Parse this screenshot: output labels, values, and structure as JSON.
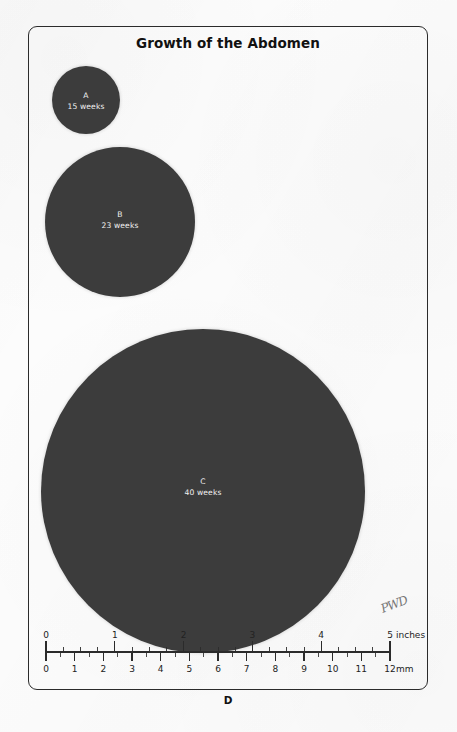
{
  "figure": {
    "title": "Growth of the Abdomen",
    "panel_letter": "D",
    "signature": "PWD",
    "frame_color": "#2b2b2b",
    "background_color": "#fcfcfc"
  },
  "circles": [
    {
      "id": "A",
      "letter": "A",
      "weeks_label": "15 weeks",
      "weeks": 15,
      "diameter_px": 68,
      "color": "#3c3c3c"
    },
    {
      "id": "B",
      "letter": "B",
      "weeks_label": "23 weeks",
      "weeks": 23,
      "diameter_px": 150,
      "color": "#3c3c3c"
    },
    {
      "id": "C",
      "letter": "C",
      "weeks_label": "40 weeks",
      "weeks": 40,
      "diameter_px": 324,
      "color": "#3c3c3c"
    }
  ],
  "ruler": {
    "top_scale": {
      "unit_label": "inches",
      "ticks": [
        "0",
        "1",
        "2",
        "3",
        "4",
        "5"
      ],
      "min": 0,
      "max": 5,
      "minor_per_major": 4
    },
    "bottom_scale": {
      "unit_label": "mm",
      "ticks": [
        "0",
        "1",
        "2",
        "3",
        "4",
        "5",
        "6",
        "7",
        "8",
        "9",
        "10",
        "11",
        "12"
      ],
      "min": 0,
      "max": 12,
      "minor_per_major": 2
    },
    "line_color": "#2b2b2b",
    "text_color": "#222222"
  },
  "chart_data": {
    "type": "scatter",
    "title": "Growth of the Abdomen",
    "xlabel": "",
    "ylabel": "",
    "categories": [
      "A",
      "B",
      "C"
    ],
    "series": [
      {
        "name": "Abdominal circumference circles (gestational age)",
        "points": [
          {
            "label": "A",
            "weeks": 15,
            "diameter_px": 68,
            "diameter_inches": 0.99
          },
          {
            "label": "B",
            "weeks": 23,
            "diameter_px": 150,
            "diameter_inches": 2.18
          },
          {
            "label": "C",
            "weeks": 40,
            "diameter_px": 324,
            "diameter_inches": 4.71
          }
        ]
      }
    ],
    "annotations": [
      "A 15 weeks",
      "B 23 weeks",
      "C 40 weeks",
      "D"
    ],
    "legend": "none",
    "grid": false
  }
}
